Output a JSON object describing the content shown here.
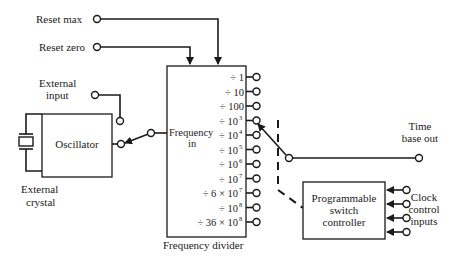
{
  "inputs": {
    "reset_max": "Reset max",
    "reset_zero": "Reset zero",
    "external_input_line1": "External",
    "external_input_line2": "input"
  },
  "oscillator": {
    "label": "Oscillator",
    "crystal_line1": "External",
    "crystal_line2": "crystal"
  },
  "divider": {
    "input_line1": "Frequency",
    "input_line2": "in",
    "caption": "Frequency divider",
    "outputs": [
      {
        "prefix": "÷ 1",
        "exp": ""
      },
      {
        "prefix": "÷ 10",
        "exp": ""
      },
      {
        "prefix": "÷ 100",
        "exp": ""
      },
      {
        "prefix": "÷ 10",
        "exp": "3"
      },
      {
        "prefix": "÷ 10",
        "exp": "4"
      },
      {
        "prefix": "÷ 10",
        "exp": "5"
      },
      {
        "prefix": "÷ 10",
        "exp": "6"
      },
      {
        "prefix": "÷ 10",
        "exp": "7"
      },
      {
        "prefix": "÷ 6 × 10",
        "exp": "7"
      },
      {
        "prefix": "÷ 10",
        "exp": "8"
      },
      {
        "prefix": "÷ 36 × 10",
        "exp": "8"
      }
    ]
  },
  "output": {
    "line1": "Time",
    "line2": "base out"
  },
  "controller": {
    "line1": "Programmable",
    "line2": "switch",
    "line3": "controller"
  },
  "clock": {
    "line1": "Clock",
    "line2": "control",
    "line3": "inputs",
    "count": 4
  }
}
